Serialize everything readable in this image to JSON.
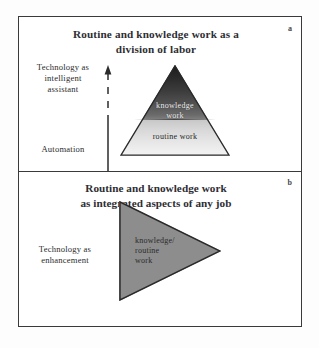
{
  "figure": {
    "background_color": "#fdfdfd",
    "frame_color": "#3a3a3a"
  },
  "panel_a": {
    "letter": "a",
    "title_line1": "Routine and knowledge work as a",
    "title_line2": "division of labor",
    "axis": {
      "top_caption_line1": "Technology as",
      "top_caption_line2": "intelligent",
      "top_caption_line3": "assistant",
      "bottom_caption": "Automation",
      "arrow_direction": "up",
      "arrow_style": "solid-lower-dashed-upper"
    },
    "pyramid": {
      "shape": "triangle-up",
      "upper_label_line1": "knowledge",
      "upper_label_line2": "work",
      "lower_label": "routine work",
      "upper_fill_color": "#1c1c1c",
      "lower_fill_color": "#e6e6e6",
      "outline_color": "#2a2a2a",
      "upper_text_color": "#f2f2f2",
      "lower_text_color": "#1f1f1f"
    }
  },
  "panel_b": {
    "letter": "b",
    "title_line1": "Routine and knowledge work",
    "title_line2": "as integrated aspects of any job",
    "caption_line1": "Technology as",
    "caption_line2": "enhancement",
    "wedge": {
      "shape": "triangle-right",
      "label_line1": "knowledge/",
      "label_line2": "routine",
      "label_line3": "work",
      "fill_color": "#8d8d8d",
      "outline_color": "#2a2a2a",
      "text_color": "#2a2a2a"
    }
  }
}
